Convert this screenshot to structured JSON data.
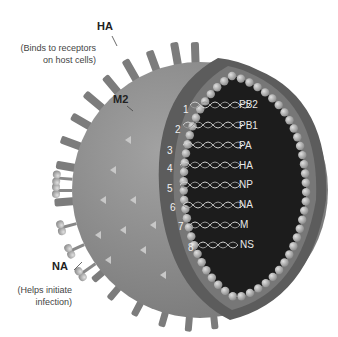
{
  "labels": {
    "ha": {
      "name": "HA",
      "note_line1": "(Binds to receptors",
      "note_line2": "on host cells)"
    },
    "m2": {
      "name": "M2"
    },
    "na": {
      "name": "NA",
      "note_line1": "(Helps initiate",
      "note_line2": "infection)"
    }
  },
  "segments": [
    {
      "num": "1",
      "name": "PB2"
    },
    {
      "num": "2",
      "name": "PB1"
    },
    {
      "num": "3",
      "name": "PA"
    },
    {
      "num": "4",
      "name": "HA"
    },
    {
      "num": "5",
      "name": "NP"
    },
    {
      "num": "6",
      "name": "NA"
    },
    {
      "num": "7",
      "name": "M"
    },
    {
      "num": "8",
      "name": "NS"
    }
  ],
  "colors": {
    "envelope": "#8e8e8e",
    "envelope_dark": "#6e6e6e",
    "cut_rim": "#5c5c5c",
    "core": "#1c1c1c",
    "bead": "#b4b4b4",
    "spike": "#7a7a7a",
    "rna": "#cfcfcf"
  }
}
